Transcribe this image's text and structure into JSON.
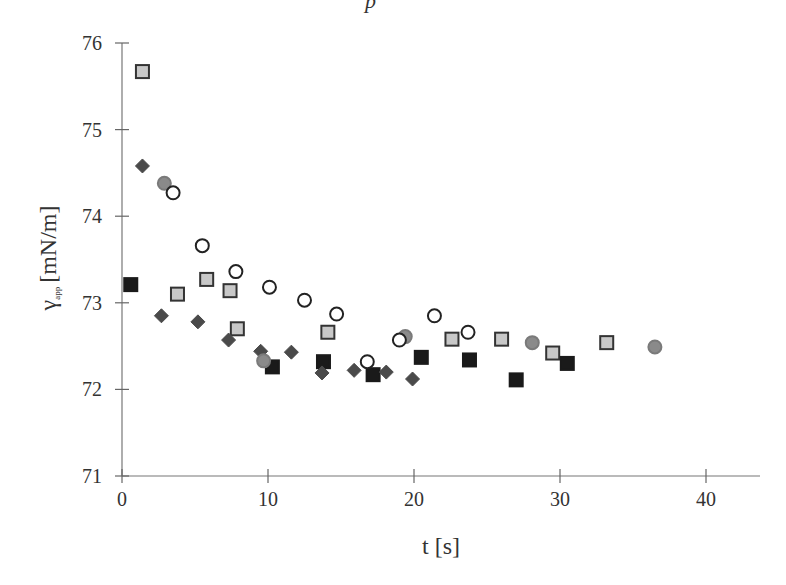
{
  "top_fragment": "p",
  "chart_data": {
    "type": "scatter",
    "title": "",
    "xlabel": "t [s]",
    "ylabel": "γ_app [mN/m]",
    "ylabel_main": "γ",
    "ylabel_sub": "app",
    "ylabel_unit": "[mN/m]",
    "xlim": [
      0,
      44
    ],
    "ylim": [
      71,
      76
    ],
    "xticks": [
      0,
      10,
      20,
      30,
      40
    ],
    "yticks": [
      71,
      72,
      73,
      74,
      75,
      76
    ],
    "grid": false,
    "legend": null,
    "series": [
      {
        "name": "light-gray squares",
        "marker": "square",
        "fill": "#c8c8c8",
        "stroke": "#333333",
        "points": [
          [
            1.4,
            75.67
          ],
          [
            3.8,
            73.1
          ],
          [
            5.8,
            73.27
          ],
          [
            7.4,
            73.14
          ],
          [
            7.9,
            72.7
          ],
          [
            14.1,
            72.66
          ],
          [
            22.6,
            72.58
          ],
          [
            26.0,
            72.58
          ],
          [
            29.5,
            72.42
          ],
          [
            33.2,
            72.54
          ]
        ]
      },
      {
        "name": "black squares",
        "marker": "square",
        "fill": "#1a1a1a",
        "stroke": "#1a1a1a",
        "points": [
          [
            0.6,
            73.21
          ],
          [
            10.3,
            72.26
          ],
          [
            13.8,
            72.32
          ],
          [
            17.2,
            72.17
          ],
          [
            20.5,
            72.37
          ],
          [
            23.8,
            72.34
          ],
          [
            27.0,
            72.11
          ],
          [
            30.5,
            72.3
          ]
        ]
      },
      {
        "name": "dark-gray diamonds",
        "marker": "diamond",
        "fill": "#4a4a4a",
        "stroke": "#4a4a4a",
        "points": [
          [
            1.4,
            74.58
          ],
          [
            2.7,
            72.85
          ],
          [
            5.2,
            72.78
          ],
          [
            7.3,
            72.57
          ],
          [
            9.5,
            72.44
          ],
          [
            11.6,
            72.43
          ],
          [
            13.7,
            72.19
          ],
          [
            15.9,
            72.22
          ],
          [
            18.1,
            72.2
          ],
          [
            19.9,
            72.12
          ]
        ]
      },
      {
        "name": "gray circles",
        "marker": "circle",
        "fill": "#8a8a8a",
        "stroke": "#7a7a7a",
        "points": [
          [
            2.9,
            74.38
          ],
          [
            9.7,
            72.33
          ],
          [
            19.4,
            72.61
          ],
          [
            28.1,
            72.54
          ],
          [
            36.5,
            72.49
          ]
        ]
      },
      {
        "name": "open circles",
        "marker": "circle",
        "fill": "#ffffff",
        "stroke": "#222222",
        "points": [
          [
            3.5,
            74.27
          ],
          [
            5.5,
            73.66
          ],
          [
            7.8,
            73.36
          ],
          [
            10.1,
            73.18
          ],
          [
            12.5,
            73.03
          ],
          [
            14.7,
            72.87
          ],
          [
            16.8,
            72.32
          ],
          [
            19.0,
            72.57
          ],
          [
            21.4,
            72.85
          ],
          [
            23.7,
            72.66
          ]
        ]
      }
    ]
  }
}
